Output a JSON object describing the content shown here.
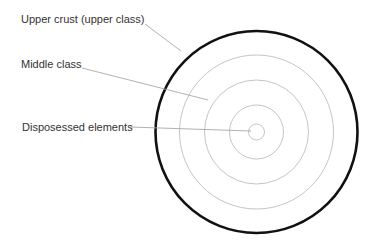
{
  "diagram": {
    "type": "concentric-circles",
    "center": {
      "x": 256.5,
      "y": 132
    },
    "rings": [
      {
        "radius": 101,
        "stroke": "#111111",
        "width": 2.6
      },
      {
        "radius": 77,
        "stroke": "#bdbdbd",
        "width": 0.9
      },
      {
        "radius": 52,
        "stroke": "#bdbdbd",
        "width": 0.9
      },
      {
        "radius": 27,
        "stroke": "#bdbdbd",
        "width": 0.9
      },
      {
        "radius": 8,
        "stroke": "#bdbdbd",
        "width": 0.9
      }
    ],
    "labels": [
      {
        "text": "Upper crust (upper class)",
        "x": 21,
        "y": 13,
        "leader": {
          "x1": 145,
          "y1": 24,
          "x2": 181,
          "y2": 51
        }
      },
      {
        "text": "Middle class",
        "x": 21,
        "y": 58,
        "leader": {
          "x1": 82,
          "y1": 68,
          "x2": 208,
          "y2": 100
        }
      },
      {
        "text": "Disposessed elements",
        "x": 22,
        "y": 121,
        "leader": {
          "x1": 130,
          "y1": 127,
          "x2": 251,
          "y2": 131
        }
      }
    ],
    "colors": {
      "text": "#333333",
      "leader": "#a8a8a8",
      "outer_ring": "#111111",
      "inner_rings": "#bdbdbd",
      "background": "#ffffff"
    }
  }
}
